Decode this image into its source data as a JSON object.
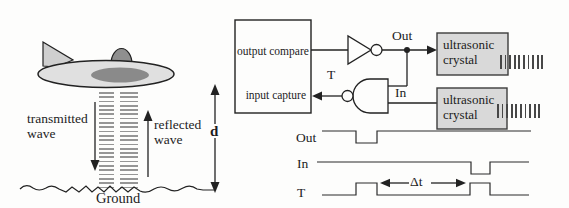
{
  "scene": {
    "labels": {
      "transmitted_line1": "transmitted",
      "transmitted_line2": "wave",
      "reflected_line1": "reflected",
      "reflected_line2": "wave",
      "ground": "Ground",
      "distance": "d"
    }
  },
  "circuit": {
    "controller": {
      "output_compare": "output compare",
      "input_capture": "input capture"
    },
    "labels": {
      "out": "Out",
      "t": "T",
      "in": "In"
    },
    "crystal_top": {
      "line1": "ultrasonic",
      "line2": "crystal"
    },
    "crystal_bottom": {
      "line1": "ultrasonic",
      "line2": "crystal"
    }
  },
  "timing": {
    "out_label": "Out",
    "in_label": "In",
    "t_label": "T",
    "delta_t_label": "Δt"
  },
  "colors": {
    "line": "#222222",
    "crystal_fill": "#d9d9d9",
    "crystal_border": "#3c3c3c",
    "saucer_fill": "#e0e0e0",
    "saucer_inner": "#8a8a8a",
    "dome_fill": "#8f8f8f",
    "tail_fill": "#cfcfcf",
    "wave_dash": "#969696",
    "background": "#fdfdfc"
  }
}
